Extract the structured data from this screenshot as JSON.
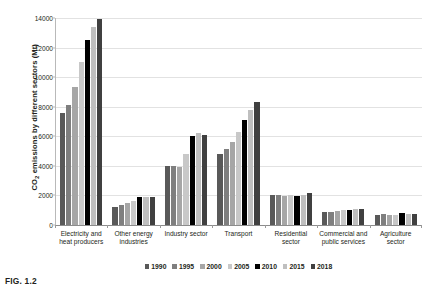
{
  "caption": "FIG. 1.2",
  "chart_data": {
    "type": "bar",
    "title": "",
    "xlabel": "",
    "ylabel": "CO2 emissions by different sectors (Mt)",
    "ylabel_prefix": "CO",
    "ylabel_sub": "2",
    "ylabel_suffix": " emissions by different sectors (Mt)",
    "ylim": [
      0,
      14000
    ],
    "yticks": [
      0,
      2000,
      4000,
      6000,
      8000,
      10000,
      12000,
      14000
    ],
    "ytick_labels": [
      "0",
      "2000",
      "4000",
      "6000",
      "8000",
      "10000",
      "12000",
      "14000"
    ],
    "grid": true,
    "legend_position": "bottom",
    "categories": [
      "Electricity and heat producers",
      "Other energy industries",
      "Industry sector",
      "Transport",
      "Residential sector",
      "Commercial and public services",
      "Agriculture sector"
    ],
    "series": [
      {
        "name": "1990",
        "color": "#595959",
        "values": [
          7600,
          1250,
          4000,
          4800,
          2000,
          900,
          700
        ]
      },
      {
        "name": "1995",
        "color": "#7f7f7f",
        "values": [
          8150,
          1350,
          4000,
          5150,
          2000,
          900,
          750
        ]
      },
      {
        "name": "2000",
        "color": "#a6a6a6",
        "values": [
          9350,
          1500,
          3950,
          5600,
          1980,
          950,
          700
        ]
      },
      {
        "name": "2005",
        "color": "#c8c8c8",
        "values": [
          11000,
          1650,
          4800,
          6300,
          2000,
          1000,
          700
        ]
      },
      {
        "name": "2010",
        "color": "#000000",
        "values": [
          12500,
          1900,
          6050,
          7100,
          1980,
          1000,
          780
        ]
      },
      {
        "name": "2015",
        "color": "#bfbfbf",
        "values": [
          13400,
          1880,
          6200,
          7750,
          2050,
          1050,
          760
        ]
      },
      {
        "name": "2018",
        "color": "#404040",
        "values": [
          13900,
          1880,
          6100,
          8350,
          2150,
          1050,
          760
        ]
      }
    ]
  }
}
